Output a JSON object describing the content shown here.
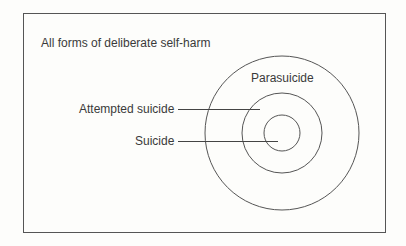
{
  "diagram": {
    "title": "All forms of deliberate self-harm",
    "circles": [
      {
        "name": "parasuicide",
        "label": "Parasuicide",
        "r": 77
      },
      {
        "name": "attempted-suicide",
        "label": "Attempted suicide",
        "r": 40
      },
      {
        "name": "suicide",
        "label": "Suicide",
        "r": 18
      }
    ],
    "labels": {
      "outer": "Parasuicide",
      "middle": "Attempted suicide",
      "inner": "Suicide"
    }
  }
}
